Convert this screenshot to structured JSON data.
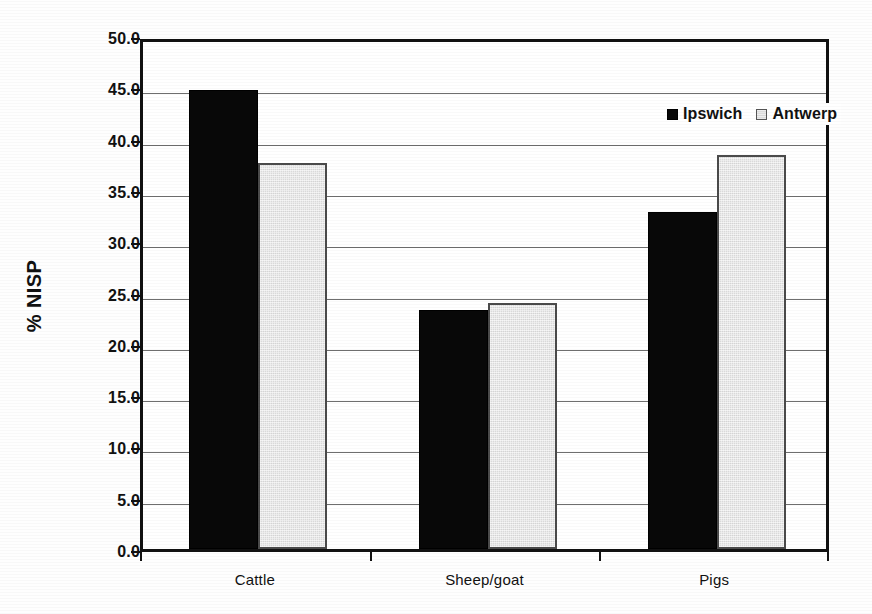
{
  "chart_data": {
    "type": "bar",
    "title": "",
    "subtitle": "",
    "xlabel": "",
    "ylabel": "% NISP",
    "categories": [
      "Cattle",
      "Sheep/goat",
      "Pigs"
    ],
    "series": [
      {
        "name": "Ipswich",
        "color": "#080808",
        "values": [
          44.7,
          23.3,
          32.8
        ]
      },
      {
        "name": "Antwerp",
        "color": "#d9d9d9",
        "values": [
          37.6,
          24.0,
          38.4
        ]
      }
    ],
    "ylim": [
      0.0,
      50.0
    ],
    "ytick_step": 5.0,
    "ytick_labels": [
      "0.0",
      "5.0",
      "10.0",
      "15.0",
      "20.0",
      "25.0",
      "30.0",
      "35.0",
      "40.0",
      "45.0",
      "50.0"
    ],
    "ytick_values": [
      0.0,
      5.0,
      10.0,
      15.0,
      20.0,
      25.0,
      30.0,
      35.0,
      40.0,
      45.0,
      50.0
    ],
    "grid": "horizontal",
    "legend_position": "inside-top-right",
    "legend_entries": [
      "Ipswich",
      "Antwerp"
    ],
    "bar_orientation": "vertical",
    "annotations": []
  },
  "figure": {
    "background_color": "#ffffff",
    "axis_color": "#111111",
    "grid_color": "#6e6e6e"
  }
}
